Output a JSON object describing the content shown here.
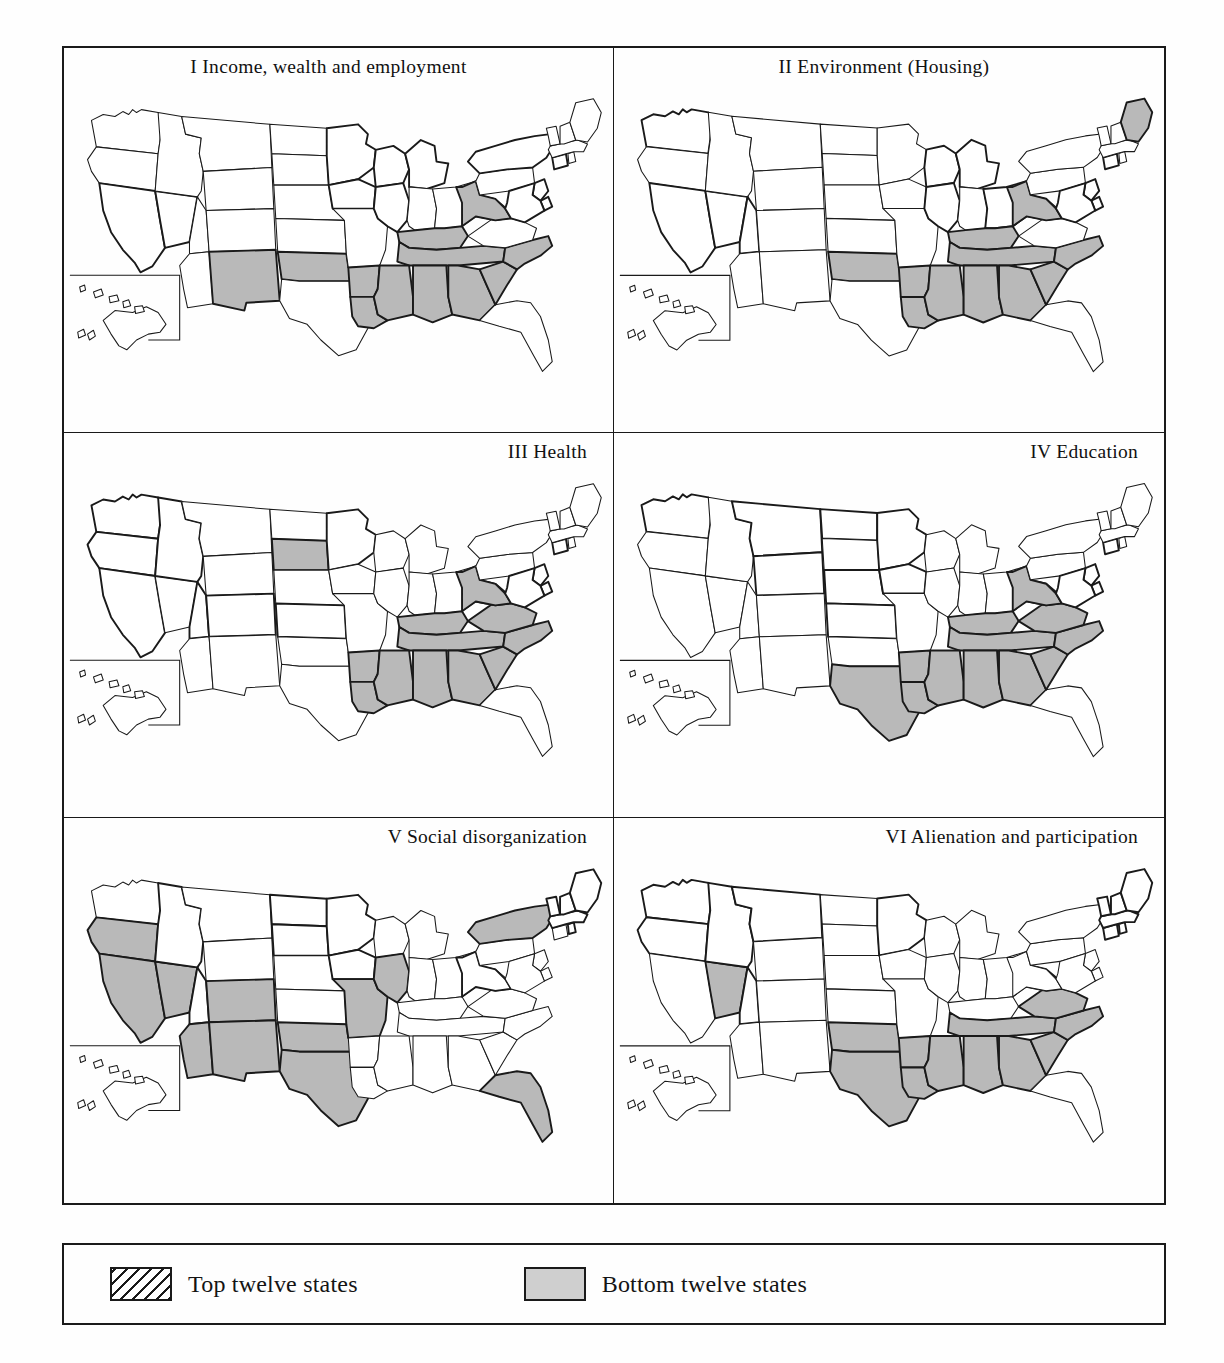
{
  "figure": {
    "legend": {
      "items": [
        {
          "label": "Top twelve states",
          "style": "hatched",
          "swatch_name": "hatched-swatch"
        },
        {
          "label": "Bottom twelve states",
          "style": "solid-gray",
          "swatch_name": "gray-swatch"
        }
      ]
    },
    "colors": {
      "gray_fill": "#b9b9b9",
      "hatch_line": "#1a1a1a",
      "outline": "#1a1a1a",
      "background": "#ffffff"
    },
    "panels": [
      {
        "id": "I",
        "title": "I  Income, wealth and employment",
        "top_twelve": [
          "CA",
          "NV",
          "MN",
          "WI",
          "IA",
          "IL",
          "NY",
          "CT",
          "NJ",
          "DE",
          "MD",
          "MI"
        ],
        "bottom_twelve": [
          "NM",
          "OK",
          "AR",
          "LA",
          "MS",
          "AL",
          "GA",
          "SC",
          "NC",
          "TN",
          "KY",
          "WV"
        ]
      },
      {
        "id": "II",
        "title": "II  Environment (Housing)",
        "top_twelve": [
          "WA",
          "CA",
          "NV",
          "UT",
          "WI",
          "MI",
          "IL",
          "OH",
          "CT",
          "NJ",
          "DE",
          "MD"
        ],
        "bottom_twelve": [
          "OK",
          "AR",
          "LA",
          "MS",
          "AL",
          "GA",
          "SC",
          "NC",
          "TN",
          "KY",
          "WV",
          "ME"
        ]
      },
      {
        "id": "III",
        "title": "III  Health",
        "top_twelve": [
          "WA",
          "OR",
          "ID",
          "CA",
          "UT",
          "CO",
          "KS",
          "MN",
          "CT",
          "NJ",
          "DE",
          "MD"
        ],
        "bottom_twelve": [
          "SD",
          "AR",
          "LA",
          "MS",
          "AL",
          "GA",
          "SC",
          "NC",
          "TN",
          "KY",
          "WV",
          "VA"
        ]
      },
      {
        "id": "IV",
        "title": "IV  Education",
        "top_twelve": [
          "WA",
          "MT",
          "ND",
          "WY",
          "NE",
          "KS",
          "MN",
          "IA",
          "NJ",
          "DE",
          "MD",
          "CT"
        ],
        "bottom_twelve": [
          "TX",
          "AR",
          "LA",
          "MS",
          "AL",
          "GA",
          "SC",
          "NC",
          "TN",
          "KY",
          "WV",
          "VA"
        ]
      },
      {
        "id": "V",
        "title": "V  Social disorganization",
        "top_twelve": [
          "ID",
          "UT",
          "ND",
          "SD",
          "MN",
          "IA",
          "WV",
          "VT",
          "NH",
          "MA",
          "RI",
          "ME"
        ],
        "bottom_twelve": [
          "OR",
          "CA",
          "NV",
          "CO",
          "AZ",
          "NM",
          "TX",
          "MO",
          "IL",
          "NY",
          "FL",
          "OK"
        ]
      },
      {
        "id": "VI",
        "title": "VI  Alienation and participation",
        "top_twelve": [
          "WA",
          "OR",
          "ID",
          "MT",
          "UT",
          "MN",
          "VT",
          "NH",
          "ME",
          "MA",
          "RI",
          "CT"
        ],
        "bottom_twelve": [
          "NV",
          "TX",
          "OK",
          "AR",
          "LA",
          "MS",
          "AL",
          "GA",
          "SC",
          "NC",
          "TN",
          "VA"
        ]
      }
    ]
  }
}
